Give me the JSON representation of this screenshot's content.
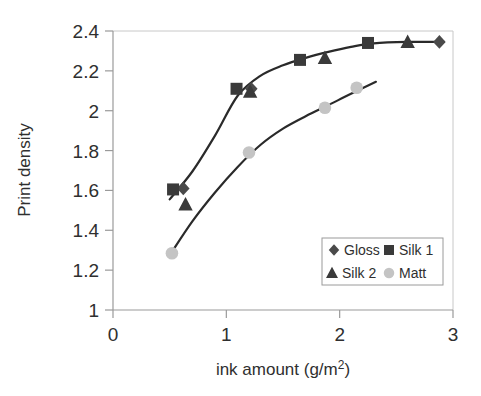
{
  "chart_data": {
    "type": "scatter",
    "title": "",
    "xlabel": "ink amount (g/m2)",
    "xlabel_main": "ink amount (g/m",
    "xlabel_sup": "2",
    "xlabel_tail": ")",
    "ylabel": "Print density",
    "xlim": [
      0,
      3
    ],
    "ylim": [
      1,
      2.4
    ],
    "xticks": [
      "0",
      "1",
      "2",
      "3"
    ],
    "xtick_values": [
      0,
      1,
      2,
      3
    ],
    "yticks": [
      "1",
      "1.2",
      "1.4",
      "1.6",
      "1.8",
      "2",
      "2.2",
      "2.4"
    ],
    "ytick_values": [
      1,
      1.2,
      1.4,
      1.6,
      1.8,
      2,
      2.2,
      2.4
    ],
    "grid": false,
    "legend_position": "lower-right",
    "series": [
      {
        "name": "Gloss",
        "marker": "diamond",
        "color": "#4a4a4a",
        "points": [
          {
            "x": 0.62,
            "y": 1.61
          },
          {
            "x": 1.22,
            "y": 2.11
          },
          {
            "x": 2.88,
            "y": 2.345
          }
        ]
      },
      {
        "name": "Silk 1",
        "marker": "square",
        "color": "#3a3a3a",
        "points": [
          {
            "x": 0.53,
            "y": 1.605
          },
          {
            "x": 1.09,
            "y": 2.11
          },
          {
            "x": 1.65,
            "y": 2.255
          },
          {
            "x": 2.25,
            "y": 2.34
          }
        ]
      },
      {
        "name": "Silk 2",
        "marker": "triangle",
        "color": "#3a3a3a",
        "points": [
          {
            "x": 0.64,
            "y": 1.53
          },
          {
            "x": 1.21,
            "y": 2.095
          },
          {
            "x": 1.87,
            "y": 2.265
          },
          {
            "x": 2.6,
            "y": 2.345
          }
        ]
      },
      {
        "name": "Matt",
        "marker": "circle",
        "color": "#c4c4c4",
        "points": [
          {
            "x": 0.52,
            "y": 1.285
          },
          {
            "x": 1.2,
            "y": 1.79
          },
          {
            "x": 1.87,
            "y": 2.015
          },
          {
            "x": 2.15,
            "y": 2.115
          }
        ]
      }
    ],
    "fitted_curves": [
      {
        "name": "upper-curve",
        "description": "Gloss / Silk 1 / Silk 2 saturation curve",
        "points": [
          {
            "x": 0.5,
            "y": 1.555
          },
          {
            "x": 0.7,
            "y": 1.695
          },
          {
            "x": 0.9,
            "y": 1.875
          },
          {
            "x": 1.1,
            "y": 2.075
          },
          {
            "x": 1.3,
            "y": 2.175
          },
          {
            "x": 1.5,
            "y": 2.228
          },
          {
            "x": 1.7,
            "y": 2.265
          },
          {
            "x": 1.9,
            "y": 2.295
          },
          {
            "x": 2.1,
            "y": 2.32
          },
          {
            "x": 2.3,
            "y": 2.338
          },
          {
            "x": 2.6,
            "y": 2.345
          },
          {
            "x": 2.92,
            "y": 2.345
          }
        ]
      },
      {
        "name": "lower-curve",
        "description": "Matt curve",
        "points": [
          {
            "x": 0.5,
            "y": 1.275
          },
          {
            "x": 0.7,
            "y": 1.445
          },
          {
            "x": 0.9,
            "y": 1.59
          },
          {
            "x": 1.1,
            "y": 1.718
          },
          {
            "x": 1.3,
            "y": 1.828
          },
          {
            "x": 1.5,
            "y": 1.91
          },
          {
            "x": 1.7,
            "y": 1.972
          },
          {
            "x": 1.9,
            "y": 2.028
          },
          {
            "x": 2.1,
            "y": 2.085
          },
          {
            "x": 2.32,
            "y": 2.145
          }
        ]
      }
    ]
  },
  "legend": {
    "entries": [
      {
        "label": "Gloss",
        "marker": "diamond"
      },
      {
        "label": "Silk 1",
        "marker": "square"
      },
      {
        "label": "Silk 2",
        "marker": "triangle"
      },
      {
        "label": "Matt",
        "marker": "circle"
      }
    ]
  }
}
